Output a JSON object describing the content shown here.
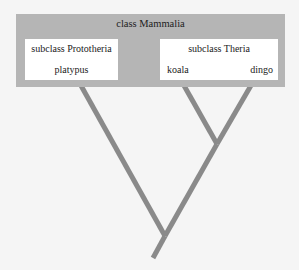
{
  "diagram": {
    "type": "cladogram",
    "class_label": "class Mammalia",
    "subclasses": [
      {
        "label": "subclass Prototheria",
        "leaves": [
          "platypus"
        ]
      },
      {
        "label": "subclass Theria",
        "leaves": [
          "koala",
          "dingo"
        ]
      }
    ],
    "colors": {
      "outer_box": "#b5b5b5",
      "inner_box": "#ffffff",
      "branch": "#8a8a8a",
      "background": "#f5f5f5"
    }
  }
}
